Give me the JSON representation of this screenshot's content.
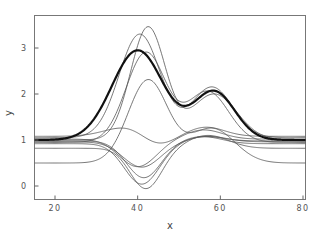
{
  "chart_data": {
    "type": "line",
    "title": "",
    "xlabel": "x",
    "ylabel": "y",
    "xlim": [
      15,
      81
    ],
    "ylim": [
      -0.2,
      3.8
    ],
    "xticks": [
      20,
      40,
      60,
      80
    ],
    "xtick_labels": [
      "20",
      "40",
      "60",
      "80"
    ],
    "yticks": [
      0,
      1,
      2,
      3
    ],
    "ytick_labels": [
      "0",
      "1",
      "2",
      "3"
    ],
    "grid": false,
    "legend": null,
    "series": [
      {
        "name": "mean",
        "style": "thick",
        "baseline": 1.0,
        "bumps": [
          [
            40,
            1.95,
            6.2
          ],
          [
            58.5,
            1.05,
            5.0
          ]
        ]
      },
      {
        "name": "curve-1",
        "style": "thin",
        "baseline": 1.05,
        "bumps": [
          [
            40.5,
            2.25,
            5.0
          ],
          [
            58,
            1.1,
            5.0
          ]
        ]
      },
      {
        "name": "curve-2",
        "style": "thin",
        "baseline": 1.0,
        "bumps": [
          [
            42.5,
            2.45,
            4.2
          ],
          [
            58.5,
            1.0,
            5.5
          ]
        ]
      },
      {
        "name": "curve-3",
        "style": "thin",
        "baseline": 0.95,
        "bumps": [
          [
            42,
            1.95,
            4.8
          ],
          [
            57,
            1.1,
            5.0
          ]
        ]
      },
      {
        "name": "curve-4",
        "style": "thin",
        "baseline": 0.5,
        "bumps": [
          [
            42.5,
            1.8,
            4.8
          ],
          [
            58,
            0.75,
            5.5
          ]
        ]
      },
      {
        "name": "curve-5",
        "style": "thin",
        "baseline": 1.08,
        "bumps": [
          [
            38,
            0.22,
            5.5
          ],
          [
            44.5,
            -0.25,
            4.0
          ],
          [
            56.5,
            0.2,
            4.5
          ]
        ]
      },
      {
        "name": "curve-6",
        "style": "thin",
        "baseline": 1.02,
        "bumps": [
          [
            40,
            -0.6,
            4.5
          ],
          [
            56,
            0.2,
            4.5
          ]
        ]
      },
      {
        "name": "curve-7",
        "style": "thin",
        "baseline": 0.98,
        "bumps": [
          [
            41.5,
            -0.8,
            4.2
          ],
          [
            56,
            0.1,
            4.5
          ]
        ]
      },
      {
        "name": "curve-8",
        "style": "thin",
        "baseline": 0.92,
        "bumps": [
          [
            41,
            -0.88,
            4.2
          ],
          [
            56,
            0.15,
            4.5
          ]
        ]
      },
      {
        "name": "curve-9",
        "style": "thin",
        "baseline": 0.82,
        "bumps": [
          [
            42,
            -0.88,
            3.8
          ],
          [
            57,
            0.28,
            5.0
          ]
        ]
      },
      {
        "name": "curve-10",
        "style": "thin",
        "baseline": 0.96,
        "bumps": [
          [
            41,
            -0.55,
            4.5
          ],
          [
            57,
            0.12,
            4.5
          ]
        ]
      }
    ]
  }
}
